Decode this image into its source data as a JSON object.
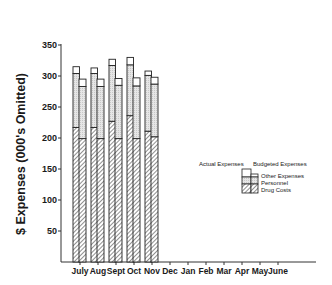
{
  "chart_data": {
    "type": "bar",
    "subtype": "stacked-grouped",
    "title": "",
    "xlabel": "",
    "ylabel": "$ Expenses (000's Omitted)",
    "ylim": [
      0,
      375
    ],
    "yticks": [
      50,
      100,
      150,
      200,
      250,
      300,
      350
    ],
    "grid": false,
    "categories": [
      "July",
      "Aug",
      "Sept",
      "Oct",
      "Nov",
      "Dec",
      "Jan",
      "Feb",
      "Mar",
      "Apr",
      "May",
      "June"
    ],
    "groups": [
      "Actual Expenses",
      "Budgeted Expenses"
    ],
    "stack_components": [
      "Drug Costs",
      "Personnel",
      "Other Expenses"
    ],
    "series": [
      {
        "name": "Actual - Drug Costs",
        "group": "Actual Expenses",
        "component": "Drug Costs",
        "values": [
          217,
          217,
          227,
          236,
          211,
          null,
          null,
          null,
          null,
          null,
          null,
          null
        ]
      },
      {
        "name": "Actual - Personnel",
        "group": "Actual Expenses",
        "component": "Personnel",
        "values": [
          87,
          87,
          90,
          82,
          90,
          null,
          null,
          null,
          null,
          null,
          null,
          null
        ]
      },
      {
        "name": "Actual - Other Expenses",
        "group": "Actual Expenses",
        "component": "Other Expenses",
        "values": [
          11,
          9,
          10,
          12,
          7,
          null,
          null,
          null,
          null,
          null,
          null,
          null
        ]
      },
      {
        "name": "Budgeted - Drug Costs",
        "group": "Budgeted Expenses",
        "component": "Drug Costs",
        "values": [
          199,
          199,
          199,
          199,
          202,
          null,
          null,
          null,
          null,
          null,
          null,
          null
        ]
      },
      {
        "name": "Budgeted - Personnel",
        "group": "Budgeted Expenses",
        "component": "Personnel",
        "values": [
          84,
          84,
          86,
          85,
          85,
          null,
          null,
          null,
          null,
          null,
          null,
          null
        ]
      },
      {
        "name": "Budgeted - Other Expenses",
        "group": "Budgeted Expenses",
        "component": "Other Expenses",
        "values": [
          12,
          12,
          11,
          13,
          11,
          null,
          null,
          null,
          null,
          null,
          null,
          null
        ]
      }
    ],
    "totals": {
      "Actual Expenses": [
        315,
        313,
        327,
        330,
        308,
        null,
        null,
        null,
        null,
        null,
        null,
        null
      ],
      "Budgeted Expenses": [
        295,
        295,
        296,
        297,
        298,
        null,
        null,
        null,
        null,
        null,
        null,
        null
      ]
    },
    "legend": {
      "placement": "right-middle",
      "header": [
        "Actual Expenses",
        "Budgeted Expenses"
      ],
      "entries": [
        {
          "label": "Other Expenses",
          "style": "white"
        },
        {
          "label": "Personnel",
          "style": "dotted-gray"
        },
        {
          "label": "Drug Costs",
          "style": "hatched"
        }
      ]
    }
  }
}
